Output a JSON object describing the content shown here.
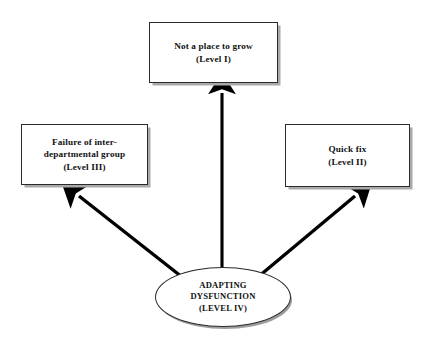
{
  "diagram": {
    "background_color": "#ffffff",
    "line_color": "#000000",
    "box_border_color": "#2b2b2b",
    "shadow_color": "#a9a9a9",
    "nodes": [
      {
        "id": "level1",
        "shape": "rectangle",
        "text": "Not a place to grow\n(Level I)",
        "line1": "Not a place to grow",
        "line2": "(Level I)"
      },
      {
        "id": "level3",
        "shape": "rectangle",
        "text": "Failure of inter-\ndepartmental group\n(Level III)",
        "line1": "Failure of inter-",
        "line2": "departmental group",
        "line3": "(Level III)"
      },
      {
        "id": "level2",
        "shape": "rectangle",
        "text": "Quick fix\n(Level II)",
        "line1": "Quick fix",
        "line2": "(Level II)"
      },
      {
        "id": "level4",
        "shape": "ellipse",
        "text": "ADAPTING\nDYSFUNCTION\n(LEVEL IV)",
        "line1": "ADAPTING",
        "line2": "DYSFUNCTION",
        "line3": "(LEVEL IV)"
      }
    ],
    "arrows": [
      {
        "id": "arrow-up",
        "from": "level4",
        "to": "level1",
        "direction": "up"
      },
      {
        "id": "arrow-up-left",
        "from": "level4",
        "to": "level3",
        "direction": "up-left"
      },
      {
        "id": "arrow-up-right",
        "from": "level4",
        "to": "level2",
        "direction": "up-right"
      }
    ]
  }
}
